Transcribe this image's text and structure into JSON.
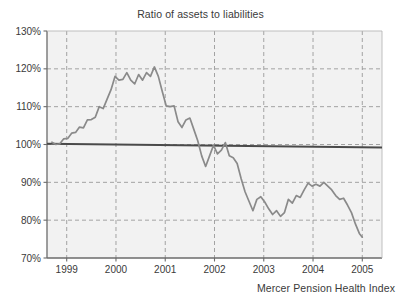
{
  "chart_data": {
    "type": "line",
    "title": "Ratio of assets to liabilities",
    "subtitle": "",
    "xlabel": "",
    "ylabel": "",
    "caption": "Mercer Pension Health Index",
    "xlim": [
      1998.6,
      2005.4
    ],
    "ylim": [
      70,
      130
    ],
    "ytick_labels": [
      "70%",
      "80%",
      "90%",
      "100%",
      "110%",
      "120%",
      "130%"
    ],
    "ytick_values": [
      70,
      80,
      90,
      100,
      110,
      120,
      130
    ],
    "xtick_labels": [
      "1999",
      "2000",
      "2001",
      "2002",
      "2003",
      "2004",
      "2005"
    ],
    "xtick_values": [
      1999,
      2000,
      2001,
      2002,
      2003,
      2004,
      2005
    ],
    "grid": "dashed-gray-both-axes",
    "legend": "none",
    "reference_line": {
      "name": "100% funded level",
      "y_start": 100.2,
      "y_end": 99.2,
      "color": "#4a4a4a",
      "style": "solid"
    },
    "series": [
      {
        "name": "Mercer Pension Health Index",
        "color": "#8a8a8a",
        "x": [
          1998.7,
          1998.78,
          1998.86,
          1998.94,
          1999.02,
          1999.1,
          1999.18,
          1999.26,
          1999.34,
          1999.42,
          1999.5,
          1999.58,
          1999.66,
          1999.74,
          1999.82,
          1999.9,
          1999.98,
          2000.06,
          2000.14,
          2000.22,
          2000.3,
          2000.38,
          2000.46,
          2000.54,
          2000.62,
          2000.7,
          2000.78,
          2000.86,
          2000.94,
          2001.02,
          2001.1,
          2001.18,
          2001.26,
          2001.34,
          2001.42,
          2001.5,
          2001.58,
          2001.66,
          2001.74,
          2001.82,
          2001.9,
          2001.98,
          2002.06,
          2002.14,
          2002.22,
          2002.3,
          2002.38,
          2002.46,
          2002.54,
          2002.62,
          2002.7,
          2002.78,
          2002.86,
          2002.94,
          2003.02,
          2003.1,
          2003.18,
          2003.26,
          2003.34,
          2003.42,
          2003.5,
          2003.58,
          2003.66,
          2003.74,
          2003.82,
          2003.9,
          2003.98,
          2004.06,
          2004.14,
          2004.22,
          2004.3,
          2004.38,
          2004.46,
          2004.54,
          2004.62,
          2004.7,
          2004.78,
          2004.86,
          2004.94,
          2005.0
        ],
        "y": [
          100.6,
          100.0,
          100.2,
          101.5,
          101.6,
          103.0,
          103.2,
          104.6,
          104.4,
          106.5,
          106.6,
          107.2,
          110.0,
          109.5,
          112.0,
          114.5,
          118.0,
          117.0,
          117.2,
          119.0,
          117.0,
          116.0,
          118.5,
          117.0,
          119.0,
          118.0,
          120.5,
          118.0,
          114.0,
          110.2,
          110.0,
          110.2,
          106.0,
          104.5,
          106.5,
          107.0,
          104.0,
          101.0,
          97.0,
          94.2,
          97.0,
          99.8,
          97.5,
          98.5,
          100.5,
          97.0,
          96.5,
          95.0,
          91.0,
          87.5,
          85.0,
          82.5,
          85.5,
          86.2,
          84.8,
          83.0,
          81.5,
          82.5,
          81.0,
          82.0,
          85.5,
          84.5,
          86.5,
          86.0,
          88.0,
          89.8,
          89.0,
          89.5,
          89.0,
          90.0,
          89.0,
          88.0,
          86.5,
          85.5,
          85.8,
          84.0,
          82.0,
          79.0,
          76.5,
          75.5
        ]
      }
    ]
  },
  "colors": {
    "plot_background": "#f2f2f2",
    "grid": "#9a9a9a",
    "axis": "#6b6b6b",
    "series": "#8a8a8a",
    "reference_line": "#4a4a4a",
    "text": "#3a3a3a"
  }
}
